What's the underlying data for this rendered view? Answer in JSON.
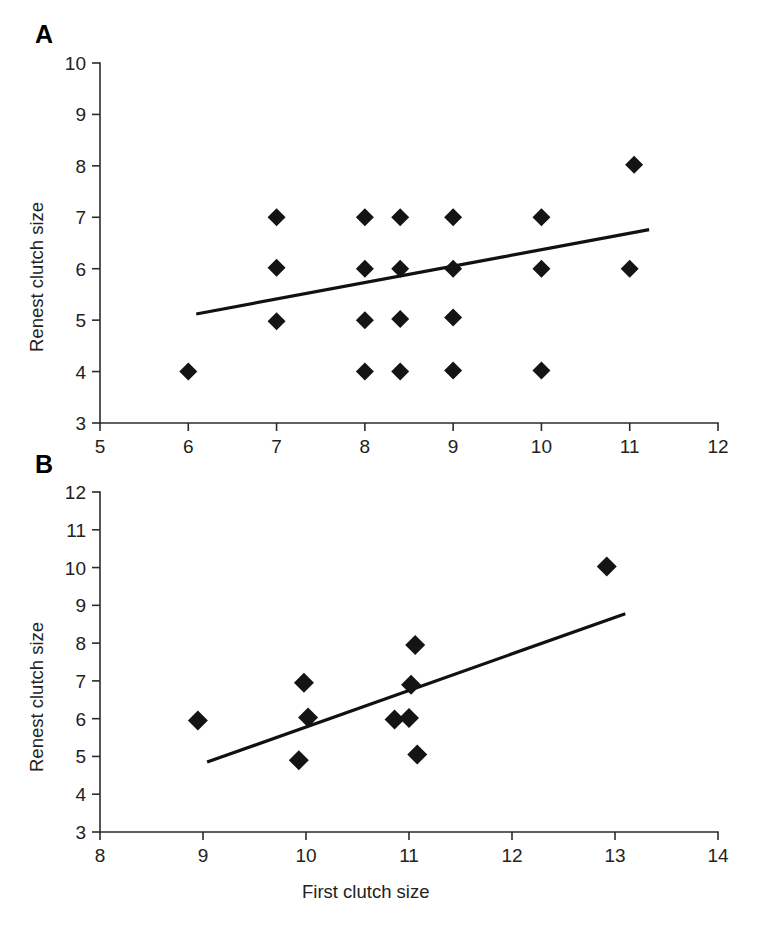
{
  "figure": {
    "background_color": "#ffffff",
    "marker_color": "#141414",
    "line_color": "#111111",
    "axis_color": "#2b2b2b",
    "shared_xlabel": "First clutch size"
  },
  "panels": [
    {
      "id": "A",
      "label": "A",
      "ylabel": "Renest clutch size",
      "xlabel": "",
      "x_ticks": [
        "5",
        "6",
        "7",
        "8",
        "9",
        "10",
        "11",
        "12"
      ],
      "y_ticks": [
        "10",
        "9",
        "8",
        "7",
        "6",
        "5",
        "4",
        "3"
      ]
    },
    {
      "id": "B",
      "label": "B",
      "ylabel": "Renest clutch size",
      "xlabel": "First clutch size",
      "x_ticks": [
        "8",
        "9",
        "10",
        "11",
        "12",
        "13",
        "14"
      ],
      "y_ticks": [
        "12",
        "11",
        "10",
        "9",
        "8",
        "7",
        "6",
        "5",
        "4",
        "3"
      ]
    }
  ],
  "chart_data": [
    {
      "type": "scatter",
      "panel": "A",
      "title": "A",
      "xlabel": "",
      "ylabel": "Renest clutch size",
      "xlim": [
        5,
        12
      ],
      "ylim": [
        3,
        10
      ],
      "xticks": [
        5,
        6,
        7,
        8,
        9,
        10,
        11,
        12
      ],
      "yticks": [
        3,
        4,
        5,
        6,
        7,
        8,
        9,
        10
      ],
      "grid": false,
      "legend": "none",
      "marker": "filled-diamond",
      "points": [
        {
          "x": 6.0,
          "y": 4.0
        },
        {
          "x": 7.0,
          "y": 4.98
        },
        {
          "x": 7.0,
          "y": 6.02
        },
        {
          "x": 7.0,
          "y": 7.0
        },
        {
          "x": 8.0,
          "y": 4.0
        },
        {
          "x": 8.0,
          "y": 5.0
        },
        {
          "x": 8.0,
          "y": 6.0
        },
        {
          "x": 8.0,
          "y": 7.0
        },
        {
          "x": 8.4,
          "y": 4.0
        },
        {
          "x": 8.4,
          "y": 5.02
        },
        {
          "x": 8.4,
          "y": 6.0
        },
        {
          "x": 8.4,
          "y": 7.0
        },
        {
          "x": 9.0,
          "y": 4.02
        },
        {
          "x": 9.0,
          "y": 5.05
        },
        {
          "x": 9.0,
          "y": 6.0
        },
        {
          "x": 9.0,
          "y": 7.0
        },
        {
          "x": 10.0,
          "y": 4.02
        },
        {
          "x": 10.0,
          "y": 6.0
        },
        {
          "x": 10.0,
          "y": 7.0
        },
        {
          "x": 11.0,
          "y": 6.0
        },
        {
          "x": 11.05,
          "y": 8.02
        }
      ],
      "trendline": {
        "x1": 6.09,
        "y1": 5.12,
        "x2": 11.22,
        "y2": 6.76
      }
    },
    {
      "type": "scatter",
      "panel": "B",
      "title": "B",
      "xlabel": "First clutch size",
      "ylabel": "Renest clutch size",
      "xlim": [
        8,
        14
      ],
      "ylim": [
        3,
        12
      ],
      "xticks": [
        8,
        9,
        10,
        11,
        12,
        13,
        14
      ],
      "yticks": [
        3,
        4,
        5,
        6,
        7,
        8,
        9,
        10,
        11,
        12
      ],
      "grid": false,
      "legend": "none",
      "marker": "filled-diamond",
      "points": [
        {
          "x": 8.95,
          "y": 5.95
        },
        {
          "x": 9.93,
          "y": 4.9
        },
        {
          "x": 9.98,
          "y": 6.95
        },
        {
          "x": 10.02,
          "y": 6.03
        },
        {
          "x": 10.86,
          "y": 5.98
        },
        {
          "x": 11.0,
          "y": 6.02
        },
        {
          "x": 11.02,
          "y": 6.9
        },
        {
          "x": 11.06,
          "y": 7.95
        },
        {
          "x": 11.08,
          "y": 5.05
        },
        {
          "x": 12.92,
          "y": 10.03
        }
      ],
      "trendline": {
        "x1": 9.04,
        "y1": 4.85,
        "x2": 13.1,
        "y2": 8.78
      }
    }
  ]
}
